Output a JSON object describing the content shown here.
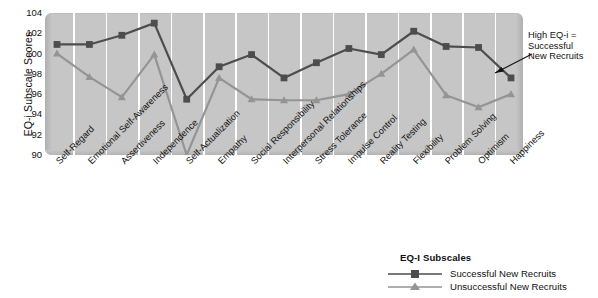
{
  "chart_data": {
    "type": "line",
    "title": "",
    "xlabel": "EQ-I Subscales",
    "ylabel": "EQ-i Subscale Scores",
    "ylim": [
      90,
      104
    ],
    "yticks": [
      104,
      102,
      100,
      98,
      96,
      94,
      92,
      90
    ],
    "grid": "vertical-white",
    "legend_position": "bottom-right",
    "categories": [
      "Self-Regard",
      "Emotional Self-Awareness",
      "Assertiveness",
      "Independence",
      "Self-Actualization",
      "Empathy",
      "Social Responsibility",
      "Interpersonal Relationships",
      "Stress Tolerance",
      "Impulse Control",
      "Reality Testing",
      "Flexibility",
      "Problem Solving",
      "Optimism",
      "Happiness"
    ],
    "series": [
      {
        "name": "Successful New Recruits",
        "color": "#4d4d4d",
        "marker": "square",
        "values": [
          100.9,
          100.9,
          101.8,
          103.0,
          95.5,
          98.7,
          99.9,
          97.6,
          99.1,
          100.5,
          99.9,
          102.2,
          100.7,
          100.6,
          97.6
        ]
      },
      {
        "name": "Unsuccessful New Recruits",
        "color": "#949494",
        "marker": "triangle",
        "values": [
          100.0,
          97.7,
          95.7,
          99.9,
          90.0,
          97.6,
          95.5,
          95.4,
          95.4,
          96.0,
          98.0,
          100.4,
          95.9,
          94.7,
          96.0
        ]
      }
    ]
  },
  "axis": {
    "y_title": "EQ-i Subscale Scores",
    "y_ticks": [
      "104",
      "102",
      "100",
      "98",
      "96",
      "94",
      "92",
      "90"
    ],
    "x_categories": [
      "Self-Regard",
      "Emotional Self-Awareness",
      "Assertiveness",
      "Independence",
      "Self-Actualization",
      "Empathy",
      "Social Responsibility",
      "Interpersonal Relationships",
      "Stress Tolerance",
      "Impulse Control",
      "Reality Testing",
      "Flexibility",
      "Problem Solving",
      "Optimism",
      "Happiness"
    ]
  },
  "annotation": {
    "line1": "High EQ-i =",
    "line2": "Successful",
    "line3": "New Recruits"
  },
  "legend": {
    "title": "EQ-I Subscales",
    "items": [
      {
        "label": "Successful New Recruits",
        "color": "#4d4d4d",
        "marker": "square"
      },
      {
        "label": "Unsuccessful New Recruits",
        "color": "#949494",
        "marker": "triangle"
      }
    ]
  },
  "colors": {
    "plot_background": "#c6c6c6",
    "gridline": "#ffffff",
    "series_successful": "#4d4d4d",
    "series_unsuccessful": "#949494",
    "text": "#111111"
  }
}
